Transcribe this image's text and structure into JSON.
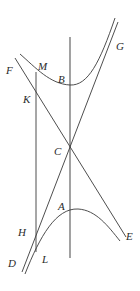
{
  "figure": {
    "labels": {
      "F": "F",
      "M": "M",
      "B": "B",
      "G": "G",
      "K": "K",
      "C": "C",
      "A": "A",
      "E": "E",
      "H": "H",
      "D": "D",
      "L": "L"
    },
    "colors": {
      "line": "#3a3a3a",
      "axis": "#555555",
      "text": "#2a2a2a",
      "background": "#ffffff"
    }
  }
}
